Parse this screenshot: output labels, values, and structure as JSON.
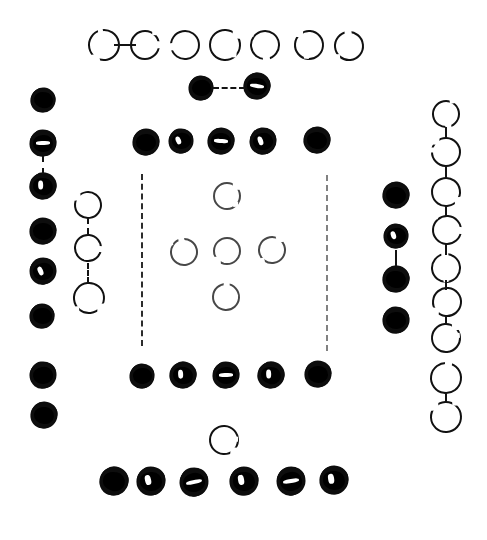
{
  "figure": {
    "width": 487,
    "height": 540,
    "background_color": "#ffffff",
    "ink_color": "#0d0d0d"
  },
  "legend": {
    "filled_label": "filled node",
    "open_label": "open ring node",
    "link_label": "dashed connector",
    "rail_label": "vertical dashed rail"
  },
  "counts": {
    "filled_nodes": 32,
    "open_nodes": 24,
    "connectors": 13,
    "rails": 2
  },
  "groups": [
    {
      "name": "top-open-row",
      "kind": "open",
      "label": "Top row of seven open rings",
      "nodes": [
        {
          "cx": 104,
          "cy": 45,
          "r": 16,
          "gap": "bottom-left"
        },
        {
          "cx": 145,
          "cy": 45,
          "r": 15,
          "gap": "right"
        },
        {
          "cx": 185,
          "cy": 45,
          "r": 15,
          "gap": "left"
        },
        {
          "cx": 225,
          "cy": 45,
          "r": 16,
          "gap": "top-right"
        },
        {
          "cx": 265,
          "cy": 45,
          "r": 15,
          "gap": "bottom"
        },
        {
          "cx": 309,
          "cy": 45,
          "r": 15,
          "gap": "top-left"
        },
        {
          "cx": 349,
          "cy": 46,
          "r": 15,
          "gap": "top"
        }
      ]
    },
    {
      "name": "upper-pair",
      "kind": "filled",
      "label": "Linked pair of filled dots below the top row",
      "nodes": [
        {
          "cx": 201,
          "cy": 88,
          "r": 12,
          "nick": false
        },
        {
          "cx": 257,
          "cy": 86,
          "r": 13,
          "nick": true
        }
      ]
    },
    {
      "name": "second-filled-row",
      "kind": "filled",
      "label": "Row of five filled dots",
      "nodes": [
        {
          "cx": 146,
          "cy": 142,
          "r": 13,
          "nick": false
        },
        {
          "cx": 181,
          "cy": 141,
          "r": 12,
          "nick": true
        },
        {
          "cx": 221,
          "cy": 141,
          "r": 13,
          "nick": true
        },
        {
          "cx": 263,
          "cy": 141,
          "r": 13,
          "nick": true
        },
        {
          "cx": 317,
          "cy": 140,
          "r": 13,
          "nick": false
        }
      ]
    },
    {
      "name": "left-filled-column",
      "kind": "filled",
      "label": "Left border column of eight filled dots",
      "nodes": [
        {
          "cx": 43,
          "cy": 100,
          "r": 12,
          "nick": false
        },
        {
          "cx": 43,
          "cy": 143,
          "r": 13,
          "nick": true
        },
        {
          "cx": 43,
          "cy": 186,
          "r": 13,
          "nick": true
        },
        {
          "cx": 43,
          "cy": 231,
          "r": 13,
          "nick": false
        },
        {
          "cx": 43,
          "cy": 271,
          "r": 13,
          "nick": true
        },
        {
          "cx": 42,
          "cy": 316,
          "r": 12,
          "nick": false
        },
        {
          "cx": 43,
          "cy": 375,
          "r": 13,
          "nick": false
        },
        {
          "cx": 44,
          "cy": 415,
          "r": 13,
          "nick": false
        }
      ]
    },
    {
      "name": "left-open-column",
      "kind": "open",
      "label": "Inner left column of three open rings",
      "nodes": [
        {
          "cx": 88,
          "cy": 205,
          "r": 14,
          "gap": "top-left"
        },
        {
          "cx": 88,
          "cy": 248,
          "r": 14,
          "gap": "right"
        },
        {
          "cx": 89,
          "cy": 298,
          "r": 16,
          "gap": "bottom-right"
        }
      ]
    },
    {
      "name": "center-cross",
      "kind": "open",
      "label": "Central cross of five faint broken rings",
      "nodes": [
        {
          "cx": 227,
          "cy": 196,
          "r": 14,
          "gap": "top-right"
        },
        {
          "cx": 184,
          "cy": 252,
          "r": 14,
          "gap": "top"
        },
        {
          "cx": 227,
          "cy": 251,
          "r": 14,
          "gap": "bottom-left"
        },
        {
          "cx": 272,
          "cy": 250,
          "r": 14,
          "gap": "top-right"
        },
        {
          "cx": 226,
          "cy": 297,
          "r": 14,
          "gap": "top"
        }
      ]
    },
    {
      "name": "right-filled-column",
      "kind": "filled",
      "label": "Inner right column of four filled dots",
      "nodes": [
        {
          "cx": 396,
          "cy": 195,
          "r": 13,
          "nick": false
        },
        {
          "cx": 396,
          "cy": 236,
          "r": 12,
          "nick": true
        },
        {
          "cx": 396,
          "cy": 279,
          "r": 13,
          "nick": false
        },
        {
          "cx": 396,
          "cy": 320,
          "r": 13,
          "nick": false
        }
      ]
    },
    {
      "name": "right-open-chain",
      "kind": "open",
      "label": "Far right vertical chain of nine open rings",
      "nodes": [
        {
          "cx": 446,
          "cy": 114,
          "r": 14,
          "gap": "bottom"
        },
        {
          "cx": 446,
          "cy": 152,
          "r": 15,
          "gap": "top-left"
        },
        {
          "cx": 446,
          "cy": 192,
          "r": 15,
          "gap": "bottom-right"
        },
        {
          "cx": 447,
          "cy": 230,
          "r": 15,
          "gap": "right"
        },
        {
          "cx": 446,
          "cy": 268,
          "r": 15,
          "gap": "top"
        },
        {
          "cx": 447,
          "cy": 302,
          "r": 15,
          "gap": "bottom-left"
        },
        {
          "cx": 446,
          "cy": 338,
          "r": 15,
          "gap": "top-right"
        },
        {
          "cx": 446,
          "cy": 378,
          "r": 16,
          "gap": "top"
        },
        {
          "cx": 446,
          "cy": 417,
          "r": 16,
          "gap": "top-left"
        }
      ]
    },
    {
      "name": "lower-filled-row",
      "kind": "filled",
      "label": "Lower row of five filled dots",
      "nodes": [
        {
          "cx": 142,
          "cy": 376,
          "r": 12,
          "nick": false
        },
        {
          "cx": 183,
          "cy": 375,
          "r": 13,
          "nick": true
        },
        {
          "cx": 226,
          "cy": 375,
          "r": 13,
          "nick": true
        },
        {
          "cx": 271,
          "cy": 375,
          "r": 13,
          "nick": true
        },
        {
          "cx": 318,
          "cy": 374,
          "r": 13,
          "nick": false
        }
      ]
    },
    {
      "name": "bottom-single-ring",
      "kind": "open",
      "label": "Single open ring above the bottom row",
      "nodes": [
        {
          "cx": 224,
          "cy": 440,
          "r": 15,
          "gap": "bottom-right"
        }
      ]
    },
    {
      "name": "bottom-filled-row",
      "kind": "filled",
      "label": "Bottom row of six filled dots",
      "nodes": [
        {
          "cx": 114,
          "cy": 481,
          "r": 14,
          "nick": false
        },
        {
          "cx": 151,
          "cy": 481,
          "r": 14,
          "nick": true
        },
        {
          "cx": 194,
          "cy": 482,
          "r": 14,
          "nick": true
        },
        {
          "cx": 244,
          "cy": 481,
          "r": 14,
          "nick": true
        },
        {
          "cx": 291,
          "cy": 481,
          "r": 14,
          "nick": true
        },
        {
          "cx": 334,
          "cy": 480,
          "r": 14,
          "nick": true
        }
      ]
    }
  ],
  "links": [
    {
      "name": "top-row-link-1-2",
      "orient": "h",
      "x": 125,
      "y": 45,
      "len": 22,
      "style": "solid"
    },
    {
      "name": "upper-pair-link",
      "orient": "h",
      "x": 229,
      "y": 88,
      "len": 32,
      "style": "dashed"
    },
    {
      "name": "left-col-link-2-3",
      "orient": "v",
      "x": 43,
      "y": 165,
      "len": 18,
      "style": "dashed"
    },
    {
      "name": "left-open-link-1-2",
      "orient": "v",
      "x": 88,
      "y": 226,
      "len": 16,
      "style": "dashed"
    },
    {
      "name": "left-open-link-2-3",
      "orient": "v",
      "x": 88,
      "y": 273,
      "len": 20,
      "style": "dashed"
    },
    {
      "name": "right-col-link-2-3",
      "orient": "v",
      "x": 396,
      "y": 258,
      "len": 16,
      "style": "solid"
    },
    {
      "name": "right-chain-link-1-2",
      "orient": "v",
      "x": 446,
      "y": 133,
      "len": 12,
      "style": "dashed"
    },
    {
      "name": "right-chain-link-2-3",
      "orient": "v",
      "x": 446,
      "y": 172,
      "len": 12,
      "style": "solid"
    },
    {
      "name": "right-chain-link-3-4",
      "orient": "v",
      "x": 446,
      "y": 211,
      "len": 12,
      "style": "dashed"
    },
    {
      "name": "right-chain-link-4-5",
      "orient": "v",
      "x": 446,
      "y": 249,
      "len": 12,
      "style": "dashed"
    },
    {
      "name": "right-chain-link-5-6",
      "orient": "v",
      "x": 446,
      "y": 285,
      "len": 10,
      "style": "solid"
    },
    {
      "name": "right-chain-link-6-7",
      "orient": "v",
      "x": 446,
      "y": 320,
      "len": 10,
      "style": "dashed"
    },
    {
      "name": "right-chain-link-8-9",
      "orient": "v",
      "x": 446,
      "y": 398,
      "len": 10,
      "style": "solid"
    }
  ],
  "rails": [
    {
      "name": "left-rail",
      "x": 142,
      "y": 174,
      "len": 172,
      "faint": false
    },
    {
      "name": "right-rail",
      "x": 327,
      "y": 175,
      "len": 176,
      "faint": true
    }
  ]
}
